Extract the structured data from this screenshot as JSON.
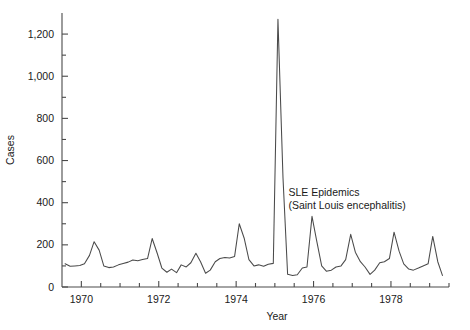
{
  "chart_data": {
    "type": "line",
    "title": "",
    "xlabel": "Year",
    "ylabel": "Cases",
    "xlim": [
      1969.5,
      1979.5
    ],
    "ylim": [
      0,
      1300
    ],
    "grid": false,
    "legend": null,
    "x_tick_labels": [
      "1970",
      "1972",
      "1974",
      "1976",
      "1978"
    ],
    "x_tick_values": [
      1970,
      1972,
      1974,
      1976,
      1978
    ],
    "x_minor_tick_step": 0.5,
    "y_tick_labels": [
      "0",
      "200",
      "400",
      "600",
      "800",
      "1,000",
      "1,200"
    ],
    "y_tick_values": [
      0,
      200,
      400,
      600,
      800,
      1000,
      1200
    ],
    "y_minor_tick_step": 100,
    "annotations": [
      {
        "line1": "SLE Epidemics",
        "line2": "(Saint Louis encephalitis)",
        "x": 1975.35,
        "y": 430
      }
    ],
    "series": [
      {
        "name": "Cases",
        "color": "#4a4a4a",
        "x": [
          1969.58,
          1969.71,
          1969.83,
          1969.96,
          1970.08,
          1970.21,
          1970.33,
          1970.46,
          1970.58,
          1970.71,
          1970.83,
          1970.96,
          1971.08,
          1971.21,
          1971.33,
          1971.46,
          1971.58,
          1971.71,
          1971.83,
          1971.96,
          1972.08,
          1972.21,
          1972.33,
          1972.46,
          1972.58,
          1972.71,
          1972.83,
          1972.96,
          1973.08,
          1973.21,
          1973.33,
          1973.46,
          1973.58,
          1973.71,
          1973.83,
          1973.96,
          1974.08,
          1974.21,
          1974.33,
          1974.46,
          1974.58,
          1974.71,
          1974.83,
          1974.96,
          1975.08,
          1975.21,
          1975.33,
          1975.46,
          1975.58,
          1975.71,
          1975.83,
          1975.96,
          1976.08,
          1976.21,
          1976.33,
          1976.46,
          1976.58,
          1976.71,
          1976.83,
          1976.96,
          1977.08,
          1977.21,
          1977.33,
          1977.46,
          1977.58,
          1977.71,
          1977.83,
          1977.96,
          1978.08,
          1978.21,
          1978.33,
          1978.46,
          1978.58,
          1978.71,
          1978.83,
          1978.96,
          1979.08,
          1979.21,
          1979.33
        ],
        "y": [
          110,
          98,
          100,
          102,
          110,
          150,
          215,
          175,
          100,
          92,
          95,
          105,
          112,
          118,
          128,
          125,
          130,
          135,
          230,
          160,
          90,
          70,
          85,
          68,
          105,
          95,
          115,
          160,
          120,
          65,
          80,
          120,
          135,
          140,
          138,
          145,
          300,
          230,
          130,
          100,
          105,
          98,
          108,
          112,
          1270,
          520,
          60,
          55,
          58,
          90,
          95,
          335,
          220,
          100,
          75,
          80,
          95,
          100,
          130,
          250,
          165,
          120,
          95,
          60,
          80,
          115,
          120,
          135,
          260,
          170,
          110,
          85,
          80,
          90,
          100,
          110,
          240,
          120,
          55
        ]
      }
    ]
  }
}
